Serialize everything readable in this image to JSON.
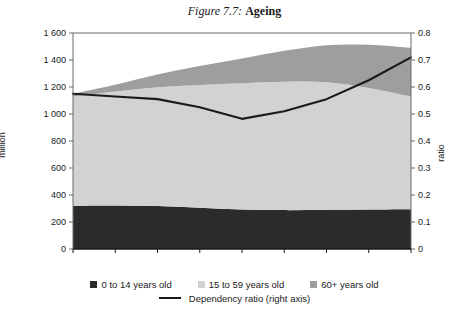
{
  "figure": {
    "label": "Figure 7.7:",
    "title": "Ageing"
  },
  "axes": {
    "left_title": "million",
    "right_title": "ratio",
    "y_left_ticks": [
      "1 600",
      "1 400",
      "1 200",
      "1 000",
      "800",
      "600",
      "400",
      "200",
      "0"
    ],
    "y_right_ticks": [
      "0.8",
      "0.7",
      "0.6",
      "0.5",
      "0.4",
      "0.3",
      "0.2",
      "0.1",
      "0"
    ],
    "x_ticks": [
      "1990",
      "1995",
      "2000",
      "2005",
      "2010",
      "2015",
      "2020",
      "2025",
      "2030"
    ]
  },
  "legend": {
    "items": [
      {
        "label": "0 to 14 years old",
        "color": "#2b2b2b",
        "type": "area"
      },
      {
        "label": "15 to 59 years old",
        "color": "#d2d2d2",
        "type": "area"
      },
      {
        "label": "60+ years old",
        "color": "#9e9e9e",
        "type": "area"
      },
      {
        "label": "Dependency ratio (right axis)",
        "color": "#1a1a1a",
        "type": "line"
      }
    ]
  },
  "colors": {
    "young": "#2b2b2b",
    "working": "#d2d2d2",
    "old": "#9e9e9e",
    "line": "#1a1a1a",
    "axis": "#6b6b6b",
    "background": "#ffffff"
  },
  "chart_data": {
    "type": "area",
    "title": "Ageing",
    "xlabel": "",
    "ylabel": "million",
    "y2label": "ratio",
    "grid": false,
    "legend_position": "bottom",
    "x": [
      1990,
      1995,
      2000,
      2005,
      2010,
      2015,
      2020,
      2025,
      2030
    ],
    "ylim": [
      0,
      1600
    ],
    "y2lim": [
      0,
      0.8
    ],
    "stacked": true,
    "series": [
      {
        "name": "0 to 14 years old",
        "axis": "left",
        "color": "#2b2b2b",
        "values": [
          320,
          322,
          318,
          305,
          292,
          288,
          290,
          293,
          295
        ]
      },
      {
        "name": "15 to 59 years old",
        "axis": "left",
        "color": "#d2d2d2",
        "values": [
          810,
          845,
          880,
          910,
          935,
          950,
          945,
          900,
          835
        ]
      },
      {
        "name": "60+ years old",
        "axis": "left",
        "color": "#9e9e9e",
        "values": [
          20,
          50,
          95,
          140,
          185,
          230,
          275,
          320,
          360
        ]
      }
    ],
    "line_series": [
      {
        "name": "Dependency ratio (right axis)",
        "axis": "right",
        "color": "#1a1a1a",
        "values": [
          0.575,
          0.565,
          0.555,
          0.525,
          0.482,
          0.51,
          0.555,
          0.625,
          0.71
        ]
      }
    ]
  }
}
